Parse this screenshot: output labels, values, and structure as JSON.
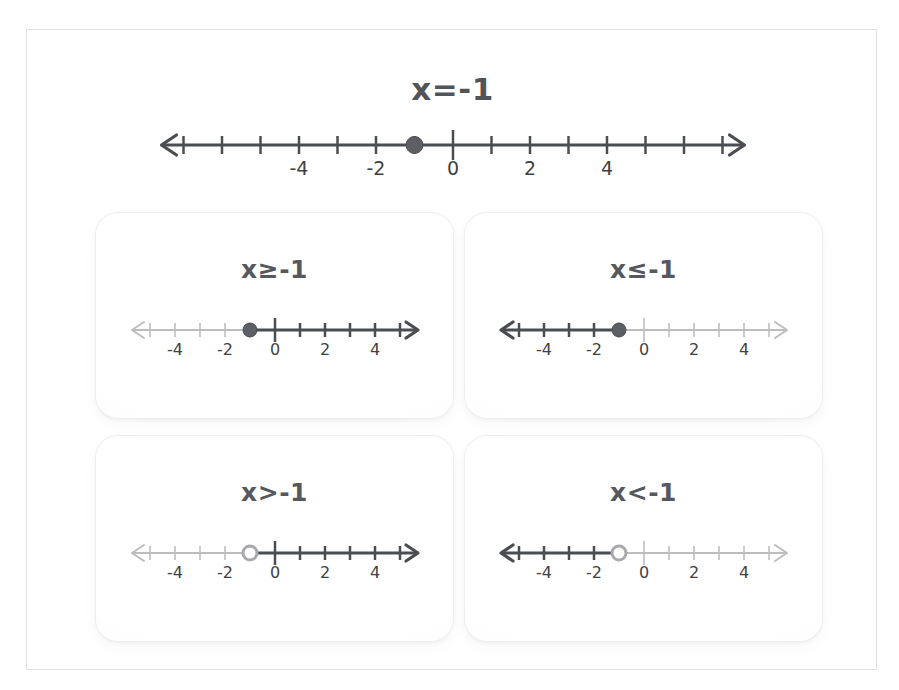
{
  "page": {
    "background_color": "#ffffff",
    "frame_border_color": "#e2e2e2",
    "title_color": "#51555a",
    "active_color": "#4a4d52",
    "inactive_color": "#bdbdbd",
    "label_color": "#3f4145"
  },
  "header": {
    "title": "x=-1",
    "numberline": {
      "min": -7,
      "max": 7,
      "tick_step": 1,
      "labels": [
        -4,
        -2,
        0,
        2,
        4
      ],
      "tall_ticks": [
        0
      ],
      "point": -1,
      "point_style": "closed",
      "shade": "none",
      "left_arrow": true,
      "right_arrow": true
    }
  },
  "cards": [
    {
      "id": "card-ge",
      "title": "x≥-1",
      "relation": "greater-or-equal",
      "numberline": {
        "min": -5,
        "max": 5,
        "tick_step": 1,
        "labels": [
          -4,
          -2,
          0,
          2,
          4
        ],
        "tall_ticks": [
          0
        ],
        "point": -1,
        "point_style": "closed",
        "shade": "right",
        "left_arrow": true,
        "right_arrow": true
      }
    },
    {
      "id": "card-le",
      "title": "x≤-1",
      "relation": "less-or-equal",
      "numberline": {
        "min": -5,
        "max": 5,
        "tick_step": 1,
        "labels": [
          -4,
          -2,
          0,
          2,
          4
        ],
        "tall_ticks": [
          0
        ],
        "point": -1,
        "point_style": "closed",
        "shade": "left",
        "left_arrow": true,
        "right_arrow": true
      }
    },
    {
      "id": "card-gt",
      "title": "x>-1",
      "relation": "greater-than",
      "numberline": {
        "min": -5,
        "max": 5,
        "tick_step": 1,
        "labels": [
          -4,
          -2,
          0,
          2,
          4
        ],
        "tall_ticks": [
          0
        ],
        "point": -1,
        "point_style": "open",
        "shade": "right",
        "left_arrow": true,
        "right_arrow": true
      }
    },
    {
      "id": "card-lt",
      "title": "x<-1",
      "relation": "less-than",
      "numberline": {
        "min": -5,
        "max": 5,
        "tick_step": 1,
        "labels": [
          -4,
          -2,
          0,
          2,
          4
        ],
        "tall_ticks": [
          0
        ],
        "point": -1,
        "point_style": "open",
        "shade": "left",
        "left_arrow": true,
        "right_arrow": true
      }
    }
  ],
  "chart_data": {
    "type": "numberline",
    "title": "x=-1",
    "plots": [
      {
        "label": "x=-1",
        "point": -1,
        "endpoint": "closed",
        "ray": "none",
        "range": [
          -7,
          7
        ]
      },
      {
        "label": "x≥-1",
        "point": -1,
        "endpoint": "closed",
        "ray": "right",
        "range": [
          -5,
          5
        ]
      },
      {
        "label": "x≤-1",
        "point": -1,
        "endpoint": "closed",
        "ray": "left",
        "range": [
          -5,
          5
        ]
      },
      {
        "label": "x>-1",
        "point": -1,
        "endpoint": "open",
        "ray": "right",
        "range": [
          -5,
          5
        ]
      },
      {
        "label": "x<-1",
        "point": -1,
        "endpoint": "open",
        "ray": "left",
        "range": [
          -5,
          5
        ]
      }
    ],
    "tick_labels": [
      -4,
      -2,
      0,
      2,
      4
    ],
    "xlabel": "",
    "ylabel": "",
    "grid": false
  }
}
